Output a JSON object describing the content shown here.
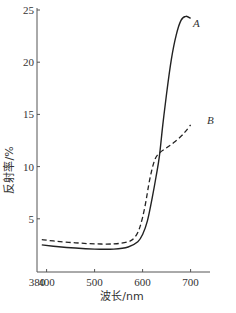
{
  "chart_data": {
    "type": "line",
    "title": "",
    "xlabel": "波长/nm",
    "ylabel": "反射率/%",
    "xlim": [
      380,
      705
    ],
    "ylim": [
      0,
      25
    ],
    "xticks": [
      380,
      400,
      500,
      600,
      700
    ],
    "yticks": [
      5,
      10,
      15,
      20,
      25
    ],
    "grid": false,
    "legend": "inline labels near curve ends",
    "series": [
      {
        "name": "A",
        "style": "solid",
        "x": [
          390,
          420,
          460,
          500,
          540,
          570,
          590,
          600,
          610,
          620,
          628,
          635,
          642,
          650,
          660,
          670,
          680,
          690,
          700
        ],
        "values": [
          2.5,
          2.35,
          2.2,
          2.1,
          2.1,
          2.3,
          2.8,
          3.5,
          4.8,
          7.0,
          9.0,
          11.0,
          14.0,
          17.0,
          20.3,
          22.6,
          24.0,
          24.4,
          24.2
        ]
      },
      {
        "name": "B",
        "style": "dashed",
        "x": [
          390,
          420,
          460,
          500,
          540,
          570,
          585,
          595,
          605,
          615,
          625,
          635,
          650,
          665,
          680,
          690,
          700
        ],
        "values": [
          3.0,
          2.85,
          2.7,
          2.6,
          2.6,
          2.8,
          3.3,
          4.3,
          6.2,
          8.8,
          10.6,
          11.3,
          11.8,
          12.3,
          12.9,
          13.4,
          14.0
        ]
      }
    ]
  },
  "labels": {
    "x_axis": "波长/nm",
    "y_axis": "反射率/%",
    "series_a": "A",
    "series_b": "B"
  }
}
